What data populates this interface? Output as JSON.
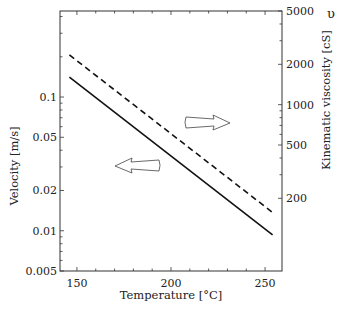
{
  "chart_data": {
    "type": "line",
    "title": "",
    "xlabel": "Temperature [°C]",
    "ylabel": "Velocity [m/s]",
    "y2label": "Kinematic viscosity [cS]",
    "y2symbol": "υ",
    "xlim": [
      141,
      259
    ],
    "ylim": [
      0.005,
      0.44
    ],
    "y2lim": [
      100,
      5000
    ],
    "yscale": "log",
    "y2scale": "log",
    "grid": false,
    "x_ticks": [
      150,
      200,
      250
    ],
    "x_tick_labels": [
      "150",
      "200",
      "250"
    ],
    "y_ticks": [
      0.1,
      0.05,
      0.02,
      0.01,
      0.005
    ],
    "y_tick_labels": [
      "0.1",
      "0.05",
      "0.02",
      "0.01",
      "0.005"
    ],
    "y2_ticks": [
      5000,
      2000,
      1000,
      500,
      200
    ],
    "y2_tick_labels": [
      "5000",
      "2000",
      "1000",
      "500",
      "200"
    ],
    "series": [
      {
        "name": "Velocity",
        "axis": "left",
        "style": "solid",
        "x": [
          146,
          254
        ],
        "values": [
          0.141,
          0.0093
        ]
      },
      {
        "name": "Kinematic viscosity",
        "axis": "right",
        "style": "dashed",
        "x": [
          146,
          255
        ],
        "values": [
          2350,
          153
        ]
      }
    ],
    "annotations": [
      {
        "type": "arrow",
        "direction": "left",
        "meaning": "solid line reads on left axis (Velocity)"
      },
      {
        "type": "arrow",
        "direction": "right",
        "meaning": "dashed line reads on right axis (Kinematic viscosity)"
      }
    ]
  }
}
